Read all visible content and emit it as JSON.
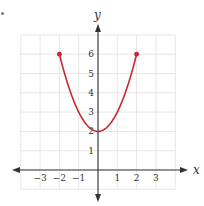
{
  "chart_data": {
    "type": "line",
    "title": "",
    "function": "y = x^2 + 2",
    "xlabel": "x",
    "ylabel": "y",
    "xlim": [
      -4,
      4
    ],
    "ylim": [
      -1,
      7
    ],
    "grid": true,
    "x_ticks": [
      -3,
      -2,
      -1,
      1,
      2,
      3
    ],
    "y_ticks": [
      1,
      2,
      3,
      4,
      5,
      6
    ],
    "x_tick_labels": [
      "−3",
      "−2",
      "−1",
      "1",
      "2",
      "3"
    ],
    "y_tick_labels": [
      "1",
      "2",
      "3",
      "4",
      "5",
      "6"
    ],
    "domain": [
      -2,
      2
    ],
    "series": [
      {
        "name": "parabola",
        "color": "#c8282a",
        "x": [
          -2,
          -1.5,
          -1,
          -0.5,
          0,
          0.5,
          1,
          1.5,
          2
        ],
        "y": [
          6,
          4.25,
          3,
          2.25,
          2,
          2.25,
          3,
          4.25,
          6
        ]
      }
    ],
    "endpoints": [
      {
        "x": -2,
        "y": 6,
        "closed": true
      },
      {
        "x": 2,
        "y": 6,
        "closed": true
      }
    ],
    "vertex": {
      "x": 0,
      "y": 2
    }
  },
  "colors": {
    "curve": "#c8282a",
    "axis": "#333333",
    "grid": "#dddddd"
  }
}
